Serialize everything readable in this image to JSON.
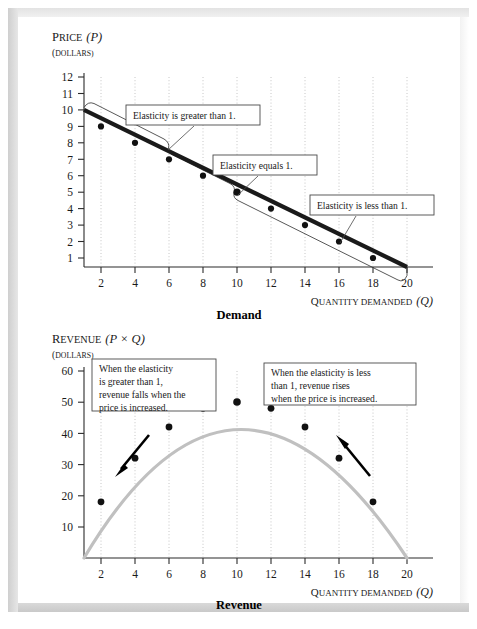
{
  "figure": {
    "background": "#ffffff",
    "frame_color": "#d8d8d8"
  },
  "demand_chart": {
    "y_axis_title_main": "Price",
    "y_axis_title_var": "(P)",
    "y_axis_units": "(Dollars)",
    "x_axis_title_main": "Quantity demanded",
    "x_axis_title_var": "(Q)",
    "chart_name": "Demand",
    "callouts": [
      {
        "name": "elastic-callout",
        "text": "Elasticity is greater than 1."
      },
      {
        "name": "unit-elastic-callout",
        "text": "Elasticity equals 1."
      },
      {
        "name": "inelastic-callout",
        "text": "Elasticity is less than 1."
      }
    ]
  },
  "revenue_chart": {
    "y_axis_title_main": "Revenue",
    "y_axis_title_var": "(P × Q)",
    "y_axis_units": "(Dollars)",
    "x_axis_title_main": "Quantity demanded",
    "x_axis_title_var": "(Q)",
    "chart_name": "Revenue",
    "callouts": [
      {
        "name": "revenue-falls-callout",
        "lines": [
          "When the elasticity",
          "is greater than 1,",
          "revenue falls when the",
          "price is increased."
        ]
      },
      {
        "name": "revenue-rises-callout",
        "lines": [
          "When the elasticity is less",
          "than 1, revenue rises",
          "when the price is increased."
        ]
      }
    ],
    "arrows": [
      {
        "name": "revenue-falls-arrow",
        "direction": "down-left"
      },
      {
        "name": "revenue-rises-arrow",
        "direction": "up-left"
      }
    ]
  },
  "chart_data": [
    {
      "type": "line",
      "title": "Demand",
      "xlabel": "Quantity demanded (Q)",
      "ylabel": "Price (P), Dollars",
      "x": [
        2,
        4,
        6,
        8,
        10,
        12,
        14,
        16,
        18,
        20
      ],
      "values": [
        9,
        8,
        7,
        6,
        5,
        4,
        3,
        2,
        1,
        0
      ],
      "line_endpoints": [
        [
          0,
          10
        ],
        [
          20,
          0
        ]
      ],
      "xlim": [
        0,
        21
      ],
      "ylim": [
        0,
        12.6
      ],
      "x_ticks": [
        2,
        4,
        6,
        8,
        10,
        12,
        14,
        16,
        18,
        20
      ],
      "y_ticks": [
        1,
        2,
        3,
        4,
        5,
        6,
        7,
        8,
        9,
        10,
        11,
        12
      ],
      "grid": true,
      "legend": "none",
      "annotations": [
        {
          "text": "Elasticity is greater than 1.",
          "region_x": [
            0,
            10
          ]
        },
        {
          "text": "Elasticity equals 1.",
          "region_x": [
            10,
            10
          ]
        },
        {
          "text": "Elasticity is less than 1.",
          "region_x": [
            10,
            20
          ]
        }
      ]
    },
    {
      "type": "line",
      "title": "Revenue",
      "xlabel": "Quantity demanded (Q)",
      "ylabel": "Revenue (P × Q), Dollars",
      "x": [
        2,
        4,
        6,
        8,
        10,
        12,
        14,
        16,
        18
      ],
      "values": [
        18,
        32,
        42,
        48,
        50,
        48,
        42,
        32,
        18
      ],
      "xlim": [
        0,
        21
      ],
      "ylim": [
        0,
        63
      ],
      "x_ticks": [
        2,
        4,
        6,
        8,
        10,
        12,
        14,
        16,
        18,
        20
      ],
      "y_ticks": [
        10,
        20,
        30,
        40,
        50,
        60
      ],
      "grid": true,
      "legend": "none",
      "annotations": [
        {
          "text": "When the elasticity is greater than 1, revenue falls when the price is increased."
        },
        {
          "text": "When the elasticity is less than 1, revenue rises when the price is increased."
        }
      ]
    }
  ]
}
